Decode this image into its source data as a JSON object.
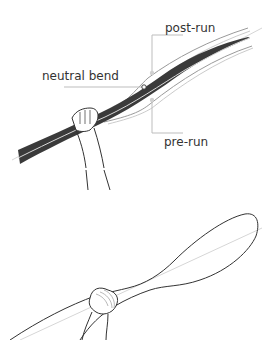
{
  "figure_top": {
    "labels": {
      "post_run": "post-run",
      "neutral_bend": "neutral bend",
      "pre_run": "pre-run"
    }
  },
  "figure_bottom": {},
  "colors": {
    "ink": "#333333",
    "shaft_dark": "#3a3a3a",
    "guide": "#c8c8c8",
    "outline": "#9a9a9a",
    "marker": "#d0d0d0"
  }
}
